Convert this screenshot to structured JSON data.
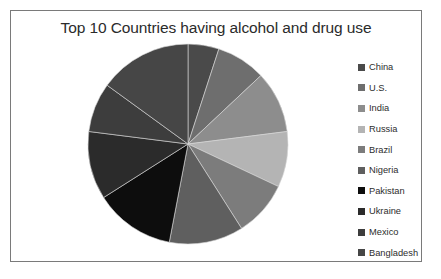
{
  "chart_data": {
    "type": "pie",
    "title": "Top 10 Countries having alcohol and drug use",
    "xlabel": "",
    "ylabel": "",
    "legend_position": "right",
    "grid": false,
    "start_angle_deg": 0,
    "direction": "clockwise",
    "categories": [
      "China",
      "U.S.",
      "India",
      "Russia",
      "Brazil",
      "Nigeria",
      "Pakistan",
      "Ukraine",
      "Mexico",
      "Bangladesh"
    ],
    "values": [
      5,
      8,
      10,
      9,
      9,
      12,
      13,
      11,
      8,
      15
    ],
    "colors": [
      "#4a4a4a",
      "#6e6e6e",
      "#8d8d8d",
      "#b4b4b4",
      "#7c7c7c",
      "#5f5f5f",
      "#0d0d0d",
      "#2b2b2b",
      "#3d3d3d",
      "#464646"
    ],
    "slices": [
      {
        "label": "China",
        "value": 5,
        "percent": 5,
        "color": "#4a4a4a",
        "start_deg": 0,
        "end_deg": 18
      },
      {
        "label": "U.S.",
        "value": 8,
        "percent": 8,
        "color": "#6e6e6e",
        "start_deg": 18,
        "end_deg": 46.8
      },
      {
        "label": "India",
        "value": 10,
        "percent": 10,
        "color": "#8d8d8d",
        "start_deg": 46.8,
        "end_deg": 82.8
      },
      {
        "label": "Russia",
        "value": 9,
        "percent": 9,
        "color": "#b4b4b4",
        "start_deg": 82.8,
        "end_deg": 115.2
      },
      {
        "label": "Brazil",
        "value": 9,
        "percent": 9,
        "color": "#7c7c7c",
        "start_deg": 115.2,
        "end_deg": 147.6
      },
      {
        "label": "Nigeria",
        "value": 12,
        "percent": 12,
        "color": "#5f5f5f",
        "start_deg": 147.6,
        "end_deg": 190.8
      },
      {
        "label": "Pakistan",
        "value": 13,
        "percent": 13,
        "color": "#0d0d0d",
        "start_deg": 190.8,
        "end_deg": 237.6
      },
      {
        "label": "Ukraine",
        "value": 11,
        "percent": 11,
        "color": "#2b2b2b",
        "start_deg": 237.6,
        "end_deg": 277.2
      },
      {
        "label": "Mexico",
        "value": 8,
        "percent": 8,
        "color": "#3d3d3d",
        "start_deg": 277.2,
        "end_deg": 306
      },
      {
        "label": "Bangladesh",
        "value": 15,
        "percent": 15,
        "color": "#464646",
        "start_deg": 306,
        "end_deg": 360
      }
    ]
  },
  "frame": {
    "border_color": "#7a7a7a",
    "background": "#ffffff"
  },
  "legend": {
    "items": [
      {
        "label": "China",
        "color": "#4a4a4a"
      },
      {
        "label": "U.S.",
        "color": "#6e6e6e"
      },
      {
        "label": "India",
        "color": "#8d8d8d"
      },
      {
        "label": "Russia",
        "color": "#b4b4b4"
      },
      {
        "label": "Brazil",
        "color": "#7c7c7c"
      },
      {
        "label": "Nigeria",
        "color": "#5f5f5f"
      },
      {
        "label": "Pakistan",
        "color": "#0d0d0d"
      },
      {
        "label": "Ukraine",
        "color": "#2b2b2b"
      },
      {
        "label": "Mexico",
        "color": "#3d3d3d"
      },
      {
        "label": "Bangladesh",
        "color": "#464646"
      }
    ]
  }
}
